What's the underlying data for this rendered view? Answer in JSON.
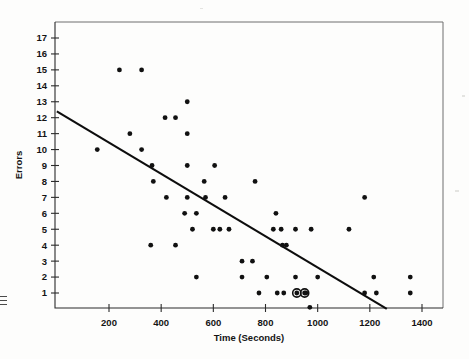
{
  "figure": {
    "kind": "scatter-plot",
    "background_color": "#fdfdfc",
    "ink_color": "#111111"
  },
  "labels": {
    "x_axis_title": "Time (Seconds)",
    "y_axis_title": "Errors"
  },
  "chart_data": {
    "type": "scatter",
    "title": "",
    "xlabel": "Time (Seconds)",
    "ylabel": "Errors",
    "xlim": [
      0,
      1500
    ],
    "ylim": [
      0,
      17.6
    ],
    "grid": false,
    "legend": null,
    "xticks": [
      200,
      400,
      600,
      800,
      1000,
      1200,
      1400
    ],
    "xtick_labels": [
      "200",
      "400",
      "600",
      "800",
      "1000",
      "1200",
      "1400"
    ],
    "yticks": [
      1,
      2,
      3,
      4,
      5,
      6,
      7,
      8,
      9,
      10,
      11,
      12,
      13,
      14,
      15,
      16,
      17
    ],
    "ytick_labels": [
      "1",
      "2",
      "3",
      "4",
      "5",
      "6",
      "7",
      "8",
      "9",
      "10",
      "11",
      "12",
      "13",
      "14",
      "15",
      "16",
      "17"
    ],
    "series": [
      {
        "name": "observations",
        "marker": "filled-circle",
        "points": [
          {
            "x": 240,
            "y": 15
          },
          {
            "x": 325,
            "y": 15
          },
          {
            "x": 500,
            "y": 13
          },
          {
            "x": 415,
            "y": 12
          },
          {
            "x": 455,
            "y": 12
          },
          {
            "x": 280,
            "y": 11
          },
          {
            "x": 500,
            "y": 11
          },
          {
            "x": 155,
            "y": 10
          },
          {
            "x": 325,
            "y": 10
          },
          {
            "x": 365,
            "y": 9
          },
          {
            "x": 500,
            "y": 9
          },
          {
            "x": 605,
            "y": 9
          },
          {
            "x": 370,
            "y": 8
          },
          {
            "x": 565,
            "y": 8
          },
          {
            "x": 760,
            "y": 8
          },
          {
            "x": 420,
            "y": 7
          },
          {
            "x": 500,
            "y": 7
          },
          {
            "x": 570,
            "y": 7
          },
          {
            "x": 645,
            "y": 7
          },
          {
            "x": 1180,
            "y": 7
          },
          {
            "x": 490,
            "y": 6
          },
          {
            "x": 535,
            "y": 6
          },
          {
            "x": 840,
            "y": 6
          },
          {
            "x": 520,
            "y": 5
          },
          {
            "x": 600,
            "y": 5
          },
          {
            "x": 625,
            "y": 5
          },
          {
            "x": 660,
            "y": 5
          },
          {
            "x": 830,
            "y": 5
          },
          {
            "x": 860,
            "y": 5
          },
          {
            "x": 915,
            "y": 5
          },
          {
            "x": 975,
            "y": 5
          },
          {
            "x": 1120,
            "y": 5
          },
          {
            "x": 360,
            "y": 4
          },
          {
            "x": 455,
            "y": 4
          },
          {
            "x": 865,
            "y": 4
          },
          {
            "x": 880,
            "y": 4
          },
          {
            "x": 710,
            "y": 3
          },
          {
            "x": 750,
            "y": 3
          },
          {
            "x": 535,
            "y": 2
          },
          {
            "x": 710,
            "y": 2
          },
          {
            "x": 805,
            "y": 2
          },
          {
            "x": 915,
            "y": 2
          },
          {
            "x": 1000,
            "y": 2
          },
          {
            "x": 1215,
            "y": 2
          },
          {
            "x": 1355,
            "y": 2
          },
          {
            "x": 775,
            "y": 1
          },
          {
            "x": 845,
            "y": 1
          },
          {
            "x": 870,
            "y": 1
          },
          {
            "x": 955,
            "y": 1
          },
          {
            "x": 1180,
            "y": 1
          },
          {
            "x": 1225,
            "y": 1
          },
          {
            "x": 1355,
            "y": 1
          },
          {
            "x": 970,
            "y": 0.1
          }
        ]
      },
      {
        "name": "highlighted-observations",
        "marker": "circled-filled-circle",
        "points": [
          {
            "x": 920,
            "y": 1
          },
          {
            "x": 950,
            "y": 1
          }
        ]
      }
    ],
    "trendline": {
      "name": "least-squares-fit",
      "x_start": 0,
      "y_start": 12.4,
      "x_end": 1265,
      "y_end": 0.0
    }
  }
}
